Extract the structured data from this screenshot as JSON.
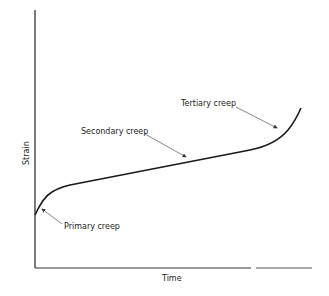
{
  "diagram": {
    "axes": {
      "x_label": "Time",
      "y_label": "Strain"
    },
    "stages": [
      {
        "label": "Primary creep"
      },
      {
        "label": "Secondary creep"
      },
      {
        "label": "Tertiary creep"
      }
    ],
    "colors": {
      "line": "#1a1a1a",
      "axis": "#222222",
      "leader": "#555555"
    }
  }
}
